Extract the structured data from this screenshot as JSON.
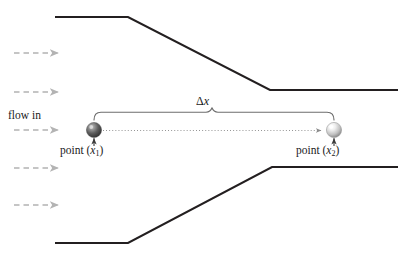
{
  "figure": {
    "type": "physics-flow-diagram",
    "background_color": "#ffffff",
    "width": 398,
    "height": 260
  },
  "labels": {
    "flow_in": "flow in",
    "delta_x": "Δx",
    "delta_symbol": "Δ",
    "delta_var": "x",
    "point_1_prefix": "point (",
    "point_1_var": "x",
    "point_1_sub": "1",
    "point_1_suffix": ")",
    "point_1_full": "point (x₁)",
    "point_2_prefix": "point (",
    "point_2_var": "x",
    "point_2_sub": "2",
    "point_2_suffix": ")",
    "point_2_full": "point (x₂)"
  },
  "colors": {
    "wall_stroke": "#231f20",
    "flow_arrow": "#b3b3b3",
    "brace_stroke": "#6e6e6e",
    "dotted_axis": "#808080",
    "text": "#1a1a1a",
    "sphere_left_dark": "#4a4a4a",
    "sphere_left_light": "#d8d8d8",
    "sphere_right_dark": "#8c8c8c",
    "sphere_right_light": "#ffffff"
  },
  "geometry": {
    "top_wall": {
      "inlet_y": 17,
      "throat_y": 90,
      "start_x": 55,
      "taper_start_x": 128,
      "taper_end_x": 270,
      "end_x": 398
    },
    "bottom_wall": {
      "inlet_y": 243,
      "throat_y": 167,
      "start_x": 55,
      "taper_start_x": 128,
      "taper_end_x": 272,
      "end_x": 398
    },
    "centerline_y": 130,
    "point_1_x": 94,
    "point_2_x": 334,
    "brace_y": 112,
    "brace_left_x": 94,
    "brace_right_x": 334
  },
  "flow_arrows": [
    {
      "name": "flow-arrow-1",
      "y": 53,
      "x_start": 14,
      "x_end": 59
    },
    {
      "name": "flow-arrow-2",
      "y": 92,
      "x_start": 14,
      "x_end": 59
    },
    {
      "name": "flow-arrow-3",
      "y": 130,
      "x_start": 14,
      "x_end": 59
    },
    {
      "name": "flow-arrow-4",
      "y": 168,
      "x_start": 14,
      "x_end": 59
    },
    {
      "name": "flow-arrow-5",
      "y": 205,
      "x_start": 14,
      "x_end": 59
    }
  ],
  "points": [
    {
      "name": "point-marker-1",
      "cx": 94,
      "cy": 130,
      "r": 7.5,
      "shade": "dark"
    },
    {
      "name": "point-marker-2",
      "cx": 334,
      "cy": 130,
      "r": 7.5,
      "shade": "light"
    }
  ]
}
